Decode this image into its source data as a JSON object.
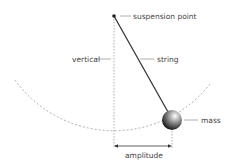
{
  "diagram": {
    "labels": {
      "suspension_point": "suspension point",
      "vertical": "vertical",
      "string": "string",
      "mass": "mass",
      "amplitude": "amplitude"
    },
    "colors": {
      "line": "#333333",
      "dashed": "#999999",
      "label": "#444444"
    }
  }
}
